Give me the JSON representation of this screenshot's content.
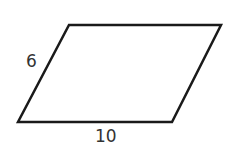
{
  "figure": {
    "shape": "parallelogram",
    "vertices": [
      [
        69,
        25
      ],
      [
        221,
        25
      ],
      [
        172,
        122
      ],
      [
        18,
        122
      ]
    ],
    "stroke_color": "#1a1a1a",
    "labels": {
      "side": "6",
      "base": "10"
    }
  }
}
